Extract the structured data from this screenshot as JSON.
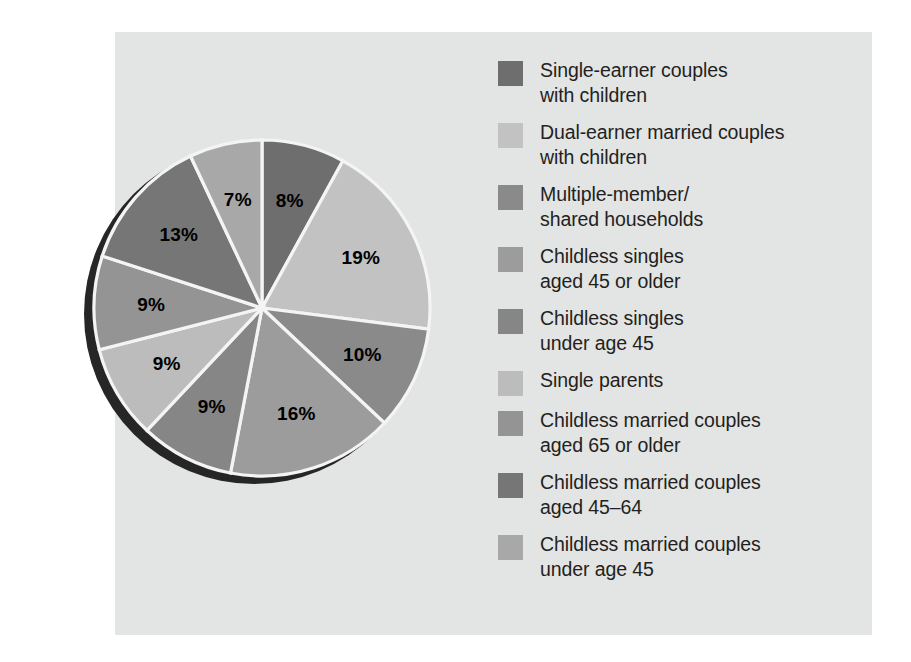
{
  "figure": {
    "background_color": "#e3e4e4",
    "page_background": "#ffffff",
    "bleed_text": "  \n   \n    \n     \n      \n       "
  },
  "chart_data": {
    "type": "pie",
    "title": "",
    "legend_position": "right",
    "start_angle_deg": 0,
    "direction": "clockwise",
    "categories": [
      "Single-earner couples with children",
      "Dual-earner married couples with children",
      "Multiple-member/ shared households",
      "Childless singles aged 45 or older",
      "Childless singles under age 45",
      "Single parents",
      "Childless married couples aged 65 or older",
      "Childless married couples aged 45–64",
      "Childless married couples under age 45"
    ],
    "values": [
      8,
      19,
      10,
      16,
      9,
      9,
      9,
      13,
      7
    ],
    "value_labels": [
      "8%",
      "19%",
      "10%",
      "16%",
      "9%",
      "9%",
      "9%",
      "13%",
      "7%"
    ],
    "colors": [
      "#6e6e6e",
      "#c2c2c2",
      "#8a8a8a",
      "#9c9c9c",
      "#868686",
      "#bcbcbc",
      "#949494",
      "#767676",
      "#a8a8a8"
    ],
    "slice_separator_color": "#f4f4f4",
    "shadow_color": "#262626",
    "total": 100
  },
  "legend": {
    "items": [
      {
        "label": "Single-earner couples\nwith children",
        "color": "#6e6e6e"
      },
      {
        "label": "Dual-earner married couples\nwith children",
        "color": "#c2c2c2"
      },
      {
        "label": "Multiple-member/\nshared households",
        "color": "#8a8a8a"
      },
      {
        "label": "Childless singles\naged 45 or older",
        "color": "#9c9c9c"
      },
      {
        "label": "Childless singles\nunder age 45",
        "color": "#868686"
      },
      {
        "label": "Single parents",
        "color": "#bcbcbc"
      },
      {
        "label": "Childless married couples\naged 65 or older",
        "color": "#949494"
      },
      {
        "label": "Childless married couples\naged 45–64",
        "color": "#767676"
      },
      {
        "label": "Childless married couples\nunder age 45",
        "color": "#a8a8a8"
      }
    ]
  }
}
